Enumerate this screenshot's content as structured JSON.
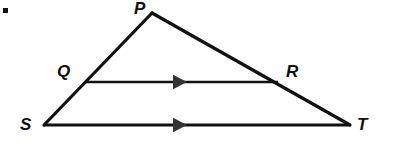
{
  "figure": {
    "kind": "geometry-diagram",
    "width": 393,
    "height": 154,
    "background_color": "#fefefe",
    "stroke_color": "#111111",
    "bullet": {
      "name": "list-bullet",
      "x": 3,
      "y": 8,
      "size": 5
    }
  },
  "labels": {
    "P": "P",
    "Q": "Q",
    "R": "R",
    "S": "S",
    "T": "T"
  },
  "chart_data": {
    "type": "scatter",
    "title": "",
    "xlabel": "",
    "ylabel": "",
    "xlim": [
      0,
      393
    ],
    "ylim": [
      154,
      0
    ],
    "grid": false,
    "legend": "none",
    "points": [
      {
        "label": "P",
        "x": 152,
        "y": 13,
        "role": "apex-vertex"
      },
      {
        "label": "Q",
        "x": 85,
        "y": 81,
        "role": "point-on-side-SP"
      },
      {
        "label": "R",
        "x": 278,
        "y": 83,
        "role": "point-on-side-PT"
      },
      {
        "label": "S",
        "x": 44,
        "y": 125,
        "role": "base-left-vertex"
      },
      {
        "label": "T",
        "x": 350,
        "y": 125,
        "role": "base-right-vertex"
      }
    ],
    "segments": [
      {
        "name": "side-SP",
        "from": "S",
        "to": "P",
        "x1": 44,
        "y1": 125,
        "x2": 152,
        "y2": 13,
        "marker": "none"
      },
      {
        "name": "side-PT",
        "from": "P",
        "to": "T",
        "x1": 152,
        "y1": 13,
        "x2": 350,
        "y2": 125,
        "marker": "none"
      },
      {
        "name": "segment-QR",
        "from": "Q",
        "to": "R",
        "x1": 85,
        "y1": 82,
        "x2": 278,
        "y2": 82,
        "marker": "single-arrow"
      },
      {
        "name": "base-ST",
        "from": "S",
        "to": "T",
        "x1": 44,
        "y1": 125,
        "x2": 350,
        "y2": 125,
        "marker": "single-arrow"
      }
    ],
    "parallel_marks": [
      {
        "name": "arrow-mark-QR",
        "on_segment": "segment-QR",
        "x": 180,
        "y": 82,
        "count": 1,
        "direction": "right"
      },
      {
        "name": "arrow-mark-ST",
        "on_segment": "base-ST",
        "x": 180,
        "y": 125,
        "count": 1,
        "direction": "right"
      }
    ],
    "annotations": [
      {
        "text": "P",
        "x": 134,
        "y": 2
      },
      {
        "text": "Q",
        "x": 57,
        "y": 65
      },
      {
        "text": "R",
        "x": 286,
        "y": 65
      },
      {
        "text": "S",
        "x": 20,
        "y": 118
      },
      {
        "text": "T",
        "x": 357,
        "y": 118
      }
    ]
  }
}
